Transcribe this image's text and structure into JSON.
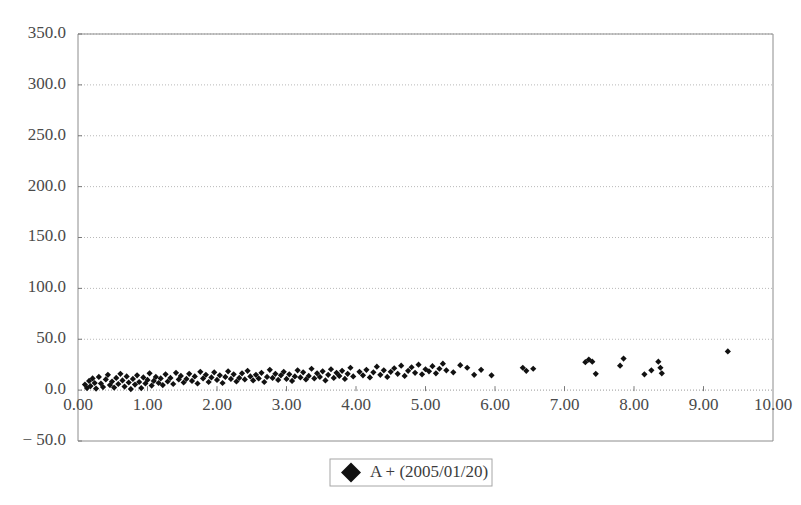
{
  "chart_data": {
    "type": "scatter",
    "title": "",
    "xlabel": "",
    "ylabel": "",
    "xlim": [
      0,
      10
    ],
    "ylim": [
      -50,
      350
    ],
    "xticks": [
      "0.00",
      "1.00",
      "2.00",
      "3.00",
      "4.00",
      "5.00",
      "6.00",
      "7.00",
      "8.00",
      "9.00",
      "10.00"
    ],
    "xtick_values": [
      0,
      1,
      2,
      3,
      4,
      5,
      6,
      7,
      8,
      9,
      10
    ],
    "yticks": [
      "350.0",
      "300.0",
      "250.0",
      "200.0",
      "150.0",
      "100.0",
      "50.0",
      "0.0",
      "− 50.0"
    ],
    "ytick_values": [
      350,
      300,
      250,
      200,
      150,
      100,
      50,
      0,
      -50
    ],
    "grid": "horizontal-dotted",
    "legend_position": "bottom-center",
    "marker": "filled-diamond",
    "marker_color": "#111111",
    "series": [
      {
        "name": "A + (2005/01/20)",
        "points": [
          [
            0.1,
            5.5
          ],
          [
            0.13,
            2.0
          ],
          [
            0.16,
            9.0
          ],
          [
            0.18,
            4.0
          ],
          [
            0.21,
            11.5
          ],
          [
            0.24,
            7.0
          ],
          [
            0.26,
            1.5
          ],
          [
            0.3,
            13.0
          ],
          [
            0.33,
            6.5
          ],
          [
            0.36,
            3.0
          ],
          [
            0.4,
            10.5
          ],
          [
            0.43,
            15.0
          ],
          [
            0.46,
            5.0
          ],
          [
            0.49,
            8.5
          ],
          [
            0.52,
            2.5
          ],
          [
            0.55,
            12.0
          ],
          [
            0.58,
            6.0
          ],
          [
            0.61,
            16.0
          ],
          [
            0.64,
            9.5
          ],
          [
            0.67,
            3.5
          ],
          [
            0.7,
            13.5
          ],
          [
            0.73,
            7.5
          ],
          [
            0.76,
            1.0
          ],
          [
            0.79,
            11.0
          ],
          [
            0.82,
            5.5
          ],
          [
            0.85,
            14.5
          ],
          [
            0.88,
            8.0
          ],
          [
            0.91,
            2.0
          ],
          [
            0.94,
            12.5
          ],
          [
            0.97,
            6.5
          ],
          [
            1.0,
            10.0
          ],
          [
            1.03,
            16.5
          ],
          [
            1.06,
            4.5
          ],
          [
            1.09,
            9.0
          ],
          [
            1.12,
            13.0
          ],
          [
            1.16,
            7.0
          ],
          [
            1.19,
            11.5
          ],
          [
            1.22,
            5.0
          ],
          [
            1.26,
            15.5
          ],
          [
            1.29,
            8.5
          ],
          [
            1.33,
            12.0
          ],
          [
            1.37,
            6.0
          ],
          [
            1.41,
            17.0
          ],
          [
            1.45,
            10.5
          ],
          [
            1.48,
            14.0
          ],
          [
            1.52,
            7.5
          ],
          [
            1.56,
            11.0
          ],
          [
            1.6,
            16.0
          ],
          [
            1.64,
            9.0
          ],
          [
            1.68,
            13.5
          ],
          [
            1.72,
            6.5
          ],
          [
            1.76,
            18.0
          ],
          [
            1.8,
            11.5
          ],
          [
            1.84,
            15.0
          ],
          [
            1.88,
            8.0
          ],
          [
            1.92,
            12.5
          ],
          [
            1.96,
            17.5
          ],
          [
            2.0,
            10.0
          ],
          [
            2.04,
            14.5
          ],
          [
            2.08,
            7.0
          ],
          [
            2.12,
            13.0
          ],
          [
            2.16,
            18.5
          ],
          [
            2.2,
            11.0
          ],
          [
            2.24,
            15.5
          ],
          [
            2.28,
            8.5
          ],
          [
            2.32,
            12.0
          ],
          [
            2.36,
            16.5
          ],
          [
            2.4,
            10.5
          ],
          [
            2.44,
            19.0
          ],
          [
            2.48,
            13.5
          ],
          [
            2.52,
            9.5
          ],
          [
            2.56,
            15.0
          ],
          [
            2.6,
            11.5
          ],
          [
            2.64,
            17.0
          ],
          [
            2.68,
            8.0
          ],
          [
            2.72,
            13.0
          ],
          [
            2.76,
            20.0
          ],
          [
            2.8,
            12.0
          ],
          [
            2.84,
            16.0
          ],
          [
            2.88,
            10.0
          ],
          [
            2.92,
            14.5
          ],
          [
            2.96,
            18.0
          ],
          [
            3.0,
            11.0
          ],
          [
            3.04,
            15.5
          ],
          [
            3.08,
            9.0
          ],
          [
            3.12,
            13.5
          ],
          [
            3.16,
            19.5
          ],
          [
            3.2,
            12.5
          ],
          [
            3.24,
            17.5
          ],
          [
            3.28,
            10.5
          ],
          [
            3.32,
            14.0
          ],
          [
            3.36,
            21.0
          ],
          [
            3.4,
            11.5
          ],
          [
            3.44,
            16.5
          ],
          [
            3.48,
            13.0
          ],
          [
            3.52,
            18.5
          ],
          [
            3.56,
            9.5
          ],
          [
            3.6,
            15.0
          ],
          [
            3.64,
            20.5
          ],
          [
            3.68,
            12.0
          ],
          [
            3.72,
            17.0
          ],
          [
            3.76,
            14.0
          ],
          [
            3.8,
            19.0
          ],
          [
            3.84,
            11.0
          ],
          [
            3.88,
            16.0
          ],
          [
            3.92,
            22.0
          ],
          [
            3.96,
            13.5
          ],
          [
            4.05,
            18.0
          ],
          [
            4.1,
            14.5
          ],
          [
            4.15,
            20.0
          ],
          [
            4.2,
            12.5
          ],
          [
            4.25,
            17.5
          ],
          [
            4.3,
            23.0
          ],
          [
            4.35,
            15.0
          ],
          [
            4.4,
            19.5
          ],
          [
            4.45,
            13.0
          ],
          [
            4.5,
            18.0
          ],
          [
            4.55,
            21.5
          ],
          [
            4.6,
            16.0
          ],
          [
            4.65,
            24.0
          ],
          [
            4.7,
            14.0
          ],
          [
            4.75,
            19.0
          ],
          [
            4.8,
            22.5
          ],
          [
            4.85,
            17.0
          ],
          [
            4.9,
            25.0
          ],
          [
            4.95,
            15.5
          ],
          [
            5.0,
            20.5
          ],
          [
            5.05,
            18.5
          ],
          [
            5.1,
            23.5
          ],
          [
            5.15,
            16.5
          ],
          [
            5.2,
            21.0
          ],
          [
            5.25,
            26.0
          ],
          [
            5.3,
            19.5
          ],
          [
            5.4,
            17.5
          ],
          [
            5.5,
            24.5
          ],
          [
            5.6,
            22.0
          ],
          [
            5.7,
            15.0
          ],
          [
            5.8,
            20.0
          ],
          [
            5.95,
            14.5
          ],
          [
            6.4,
            22.0
          ],
          [
            6.45,
            19.0
          ],
          [
            6.55,
            21.0
          ],
          [
            7.3,
            27.5
          ],
          [
            7.35,
            30.0
          ],
          [
            7.4,
            28.0
          ],
          [
            7.45,
            16.0
          ],
          [
            7.8,
            24.0
          ],
          [
            7.85,
            31.0
          ],
          [
            8.15,
            15.5
          ],
          [
            8.25,
            19.5
          ],
          [
            8.35,
            28.0
          ],
          [
            8.38,
            22.0
          ],
          [
            8.4,
            16.5
          ],
          [
            9.35,
            38.0
          ]
        ]
      }
    ]
  },
  "legend": {
    "marker_glyph": "diamond-marker-icon",
    "label": "A + (2005/01/20)"
  }
}
